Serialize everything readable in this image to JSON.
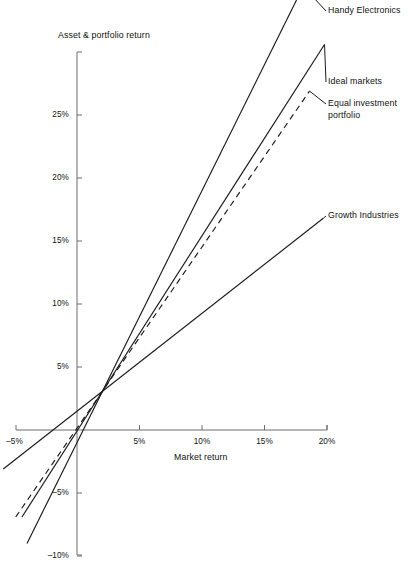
{
  "chart_data": {
    "type": "line",
    "title": "",
    "xlabel": "Market return",
    "ylabel": "Asset & portfolio return",
    "xlim": [
      -6.5,
      21.0
    ],
    "ylim": [
      -10.5,
      30.0
    ],
    "grid": false,
    "legend_position": "right-of-line-ends",
    "x_ticks": [
      -5,
      5,
      10,
      15,
      20
    ],
    "x_tick_labels": [
      "–5%",
      "5%",
      "10%",
      "15%",
      "20%"
    ],
    "y_ticks": [
      -10,
      -5,
      5,
      10,
      15,
      20,
      25
    ],
    "y_tick_labels": [
      "–10%",
      "–5%",
      "5%",
      "10%",
      "15%",
      "20%",
      "25%"
    ],
    "intersection_point": {
      "x": 2.0,
      "y": 3.0
    },
    "series": [
      {
        "name": "Handy Electronics",
        "style": "solid",
        "beta": 2.0,
        "alpha": -1.0,
        "x_start": -4.0,
        "x_end": 18.1,
        "y_start": -9.0,
        "y_end": 35.2
      },
      {
        "name": "Ideal markets",
        "style": "solid",
        "beta": 1.55,
        "alpha": -0.1,
        "x_start": -4.4,
        "x_end": 19.8,
        "y_start": -6.9,
        "y_end": 30.6
      },
      {
        "name": "Equal investment portfolio",
        "style": "dashed",
        "beta": 1.44,
        "alpha": 0.12,
        "x_start": -4.9,
        "x_end": 18.6,
        "y_start": -6.9,
        "y_end": 26.9
      },
      {
        "name": "Growth Industries",
        "style": "solid",
        "beta": 0.78,
        "alpha": 1.44,
        "x_start": -5.9,
        "x_end": 19.7,
        "y_start": -3.1,
        "y_end": 16.8
      }
    ]
  },
  "labels": {
    "y_axis_title": "Asset & portfolio return",
    "x_axis_title": "Market return",
    "series_callouts": [
      {
        "name": "Handy Electronics",
        "text": "Handy Electronics"
      },
      {
        "name": "Ideal markets",
        "text": "Ideal markets"
      },
      {
        "name": "Equal investment portfolio",
        "text": "Equal investment\nportfolio"
      },
      {
        "name": "Growth Industries",
        "text": "Growth Industries"
      }
    ]
  },
  "colors": {
    "background": "#ffffff",
    "line": "#1a1a1a",
    "axis": "#6d6d6d",
    "text": "#111111"
  }
}
